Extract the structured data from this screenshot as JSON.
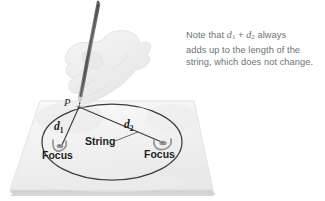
{
  "figure": {
    "title_text": "",
    "note": {
      "lines": [
        "Note that d1 + d2 always",
        "adds up to the length of the",
        "string, which does not change."
      ],
      "line1_pre": "Note that ",
      "line1_var1": "d",
      "line1_sub1": "1",
      "line1_plus": " + ",
      "line1_var2": "d",
      "line1_sub2": "2",
      "line1_post": " always",
      "line2": "adds up to the length of the",
      "line3": "string, which does not change."
    },
    "labels": {
      "point_p": "P",
      "d1_var": "d",
      "d1_sub": "1",
      "d2_var": "d",
      "d2_sub": "2",
      "string": "String",
      "focus_left": "Focus",
      "focus_right": "Focus"
    },
    "colors": {
      "note_text": "#6c7376",
      "label_text": "#231f20",
      "ellipse_stroke": "#3b3b3b",
      "string_stroke": "#3b3b3b",
      "paper_fill": "#f2f2f2",
      "paper_edge": "#d8d8d8",
      "paper_shadow": "#c9c9c9",
      "pencil_body": "#7a7c7e",
      "pencil_dark": "#4a4c4e",
      "hand_fill": "#f0f0f0",
      "hand_stroke": "#dcdcdc",
      "tack_fill": "#9a9a9a"
    },
    "geometry": {
      "paper_corners": "40,101 194,101 213,190 10,190",
      "ellipse_center_x": 112,
      "ellipse_center_y": 142,
      "ellipse_rx": 70,
      "ellipse_ry": 38,
      "point_p_x": 79,
      "point_p_y": 107,
      "focus_left_x": 61,
      "focus_left_y": 146,
      "focus_right_x": 163,
      "focus_right_y": 144,
      "pencil_tip_x": 78,
      "pencil_tip_y": 104,
      "pencil_top_x": 98,
      "pencil_top_y": 4
    }
  }
}
